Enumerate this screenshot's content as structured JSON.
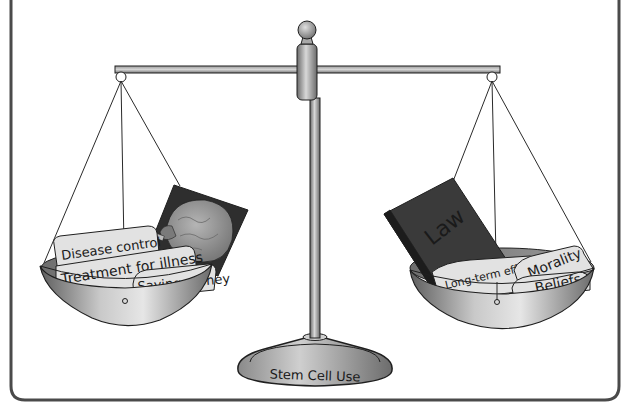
{
  "figure": {
    "topic": "Stem Cell Use",
    "base_label": "Stem Cell Use",
    "left_pan": {
      "side": "for",
      "image": "brain-illustration",
      "items": [
        {
          "label": "Disease control"
        },
        {
          "label": "Treatment for illness"
        },
        {
          "label": "Saving money"
        }
      ]
    },
    "right_pan": {
      "side": "against",
      "book_label": "Law",
      "items": [
        {
          "label": "Long-term effects"
        },
        {
          "label": "Morality"
        },
        {
          "label": "Beliefs"
        }
      ]
    }
  },
  "colors": {
    "frame": "#4a4a4a",
    "metal_light": "#d6d6d6",
    "metal_dark": "#6f6f6f",
    "paper": "#e2e2e2",
    "book": "#3a3a3a",
    "brain_bg": "#2e2e2e",
    "brain": "#9a9a9a",
    "outline": "#1f1f1f"
  }
}
